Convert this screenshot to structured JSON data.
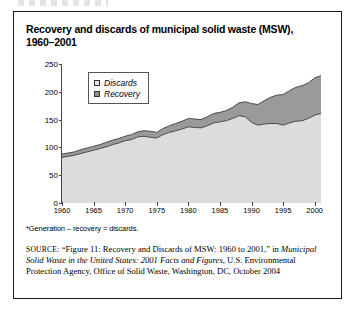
{
  "figure": {
    "title_line1": "Recovery and discards of municipal solid waste (MSW),",
    "title_line2": "1960–2001",
    "footnote": "*Generation – recovery = discards.",
    "source_label": "SOURCE:",
    "source_text_1": "“Figure 11: Recovery and Discards of MSW: 1960 to 2001,” in",
    "source_text_italic": "Municipal Solid Waste in the United States: 2001 Facts and Figures,",
    "source_text_2": "U.S. Environmental Protection Agency, Office of Solid Waste,",
    "source_text_3": "Washington, DC, October 2004"
  },
  "colors": {
    "discards_fill": "#dcdcdc",
    "recovery_fill": "#9a9a9a",
    "line_stroke": "#4a4a4a",
    "axis": "#444444",
    "frame": "#1a1a1a"
  },
  "chart_data": {
    "type": "area",
    "title": "Recovery and discards of municipal solid waste (MSW), 1960–2001",
    "xlabel": "",
    "ylabel": "Million tons",
    "xlim": [
      1960,
      2001
    ],
    "ylim": [
      0,
      250
    ],
    "yticks": [
      0,
      50,
      100,
      150,
      200,
      250
    ],
    "xticks": [
      1960,
      1965,
      1970,
      1975,
      1980,
      1985,
      1990,
      1995,
      2000
    ],
    "grid": false,
    "stacked": true,
    "legend_position": "upper-left-inside",
    "x": [
      1960,
      1961,
      1962,
      1963,
      1964,
      1965,
      1966,
      1967,
      1968,
      1969,
      1970,
      1971,
      1972,
      1973,
      1974,
      1975,
      1976,
      1977,
      1978,
      1979,
      1980,
      1981,
      1982,
      1983,
      1984,
      1985,
      1986,
      1987,
      1988,
      1989,
      1990,
      1991,
      1992,
      1993,
      1994,
      1995,
      1996,
      1997,
      1998,
      1999,
      2000,
      2001
    ],
    "series": [
      {
        "name": "Discards",
        "stack_order": 1,
        "values": [
          82,
          84,
          86,
          89,
          92,
          95,
          98,
          101,
          105,
          108,
          112,
          114,
          119,
          120,
          118,
          117,
          123,
          127,
          130,
          133,
          137,
          136,
          135,
          139,
          144,
          146,
          148,
          152,
          157,
          155,
          145,
          140,
          142,
          143,
          143,
          140,
          144,
          147,
          148,
          152,
          158,
          161
        ]
      },
      {
        "name": "Recovery",
        "stack_order": 2,
        "values": [
          6,
          6,
          6,
          7,
          7,
          7,
          7,
          8,
          8,
          8,
          8,
          9,
          9,
          10,
          11,
          10,
          11,
          12,
          13,
          14,
          15,
          15,
          15,
          16,
          17,
          17,
          18,
          20,
          23,
          27,
          34,
          37,
          42,
          47,
          51,
          55,
          58,
          61,
          63,
          64,
          67,
          68
        ]
      }
    ],
    "legend": [
      {
        "label": "Discards",
        "swatch": "#e6e6e6"
      },
      {
        "label": "Recovery",
        "swatch": "#8f8f8f"
      }
    ]
  }
}
